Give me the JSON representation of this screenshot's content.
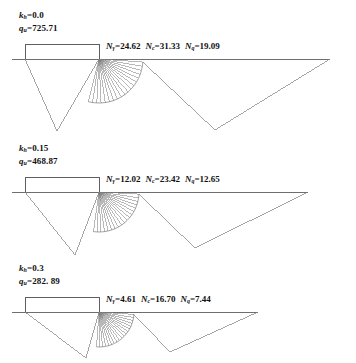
{
  "figure": {
    "title": "",
    "type": "engineering-diagram",
    "colors": {
      "line": "#7d7d7d",
      "ground_line": "#6e6e6e",
      "footing": "#5f5f5f",
      "text": "#111111",
      "background": "#ffffff"
    }
  },
  "panels": [
    {
      "id": "panel-1",
      "kh": {
        "symbol": "k",
        "subscript": "h",
        "eq": "=",
        "value": "0.0"
      },
      "qu": {
        "symbol": "q",
        "subscript": "u",
        "eq": "=",
        "value": "725.71"
      },
      "factors": [
        {
          "symbol": "N",
          "subscript": "γ",
          "eq": "=",
          "value": "24.62"
        },
        {
          "symbol": "N",
          "subscript": "c",
          "eq": "=",
          "value": "31.33"
        },
        {
          "symbol": "N",
          "subscript": "q",
          "eq": "=",
          "value": "19.09"
        }
      ]
    },
    {
      "id": "panel-2",
      "kh": {
        "symbol": "k",
        "subscript": "h",
        "eq": "=",
        "value": "0.15"
      },
      "qu": {
        "symbol": "q",
        "subscript": "u",
        "eq": "=",
        "value": "468.87"
      },
      "factors": [
        {
          "symbol": "N",
          "subscript": "γ",
          "eq": "=",
          "value": "12.02"
        },
        {
          "symbol": "N",
          "subscript": "c",
          "eq": "=",
          "value": "23.42"
        },
        {
          "symbol": "N",
          "subscript": "q",
          "eq": "=",
          "value": "12.65"
        }
      ]
    },
    {
      "id": "panel-3",
      "kh": {
        "symbol": "k",
        "subscript": "h",
        "eq": "=",
        "value": "0.3"
      },
      "qu": {
        "symbol": "q",
        "subscript": "u",
        "eq": "=",
        "value": "282. 89"
      },
      "factors": [
        {
          "symbol": "N",
          "subscript": "γ",
          "eq": "=",
          "value": "4.61"
        },
        {
          "symbol": "N",
          "subscript": "c",
          "eq": "=",
          "value": "16.70"
        },
        {
          "symbol": "N",
          "subscript": "q",
          "eq": "=",
          "value": "7.44"
        }
      ]
    }
  ],
  "chart_data": {
    "type": "diagram",
    "title": "",
    "panel_geometry": [
      {
        "panel": "panel-1",
        "ground_y": 59,
        "ground_x_left": 12,
        "ground_x_right": 330,
        "footing_left": 25,
        "footing_right": 99,
        "footing_top": 44,
        "apex_x": 99,
        "apex_y": 59,
        "active_toe_x": 57,
        "active_toe_y": 131,
        "spiral_r0": 44,
        "spiral_a_start": 104,
        "spiral_a_end": 4,
        "spiral_growth": 0.0,
        "passive_tip_x": 215,
        "passive_tip_y": 130,
        "radial_count": 18
      },
      {
        "panel": "panel-2",
        "ground_y": 192,
        "ground_x_left": 12,
        "ground_x_right": 308,
        "footing_left": 25,
        "footing_right": 99,
        "footing_top": 177,
        "apex_x": 99,
        "apex_y": 192,
        "active_toe_x": 75,
        "active_toe_y": 255,
        "spiral_r0": 40,
        "spiral_a_start": 98,
        "spiral_a_end": 3,
        "spiral_growth": 0.0,
        "passive_tip_x": 195,
        "passive_tip_y": 248,
        "radial_count": 18
      },
      {
        "panel": "panel-3",
        "ground_y": 312,
        "ground_x_left": 12,
        "ground_x_right": 258,
        "footing_left": 25,
        "footing_right": 99,
        "footing_top": 297,
        "apex_x": 99,
        "apex_y": 312,
        "active_toe_x": 86,
        "active_toe_y": 358,
        "spiral_r0": 35,
        "spiral_a_start": 94,
        "spiral_a_end": 4,
        "spiral_growth": 0.0,
        "passive_tip_x": 170,
        "passive_tip_y": 352,
        "radial_count": 18
      }
    ],
    "series": [
      {
        "name": "k_h",
        "values": [
          0.0,
          0.15,
          0.3
        ]
      },
      {
        "name": "q_u",
        "values": [
          725.71,
          468.87,
          282.89
        ]
      },
      {
        "name": "N_gamma",
        "values": [
          24.62,
          12.02,
          4.61
        ]
      },
      {
        "name": "N_c",
        "values": [
          31.33,
          23.42,
          16.7
        ]
      },
      {
        "name": "N_q",
        "values": [
          19.09,
          12.65,
          7.44
        ]
      }
    ],
    "xlabel": "",
    "ylabel": "",
    "grid": false,
    "legend": "none"
  }
}
